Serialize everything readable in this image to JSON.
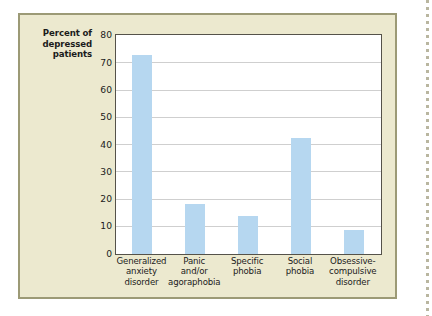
{
  "chart_data": {
    "type": "bar",
    "title": "",
    "xlabel": "",
    "ylabel": "Percent of depressed patients",
    "ylabel_lines": [
      "Percent of",
      "depressed",
      "patients"
    ],
    "ylim": [
      0,
      80
    ],
    "ytick_values": [
      0,
      10,
      20,
      30,
      40,
      50,
      60,
      70,
      80
    ],
    "ytick_labels": [
      "0",
      "10",
      "20",
      "30",
      "40",
      "50",
      "60",
      "70",
      "80"
    ],
    "grid": true,
    "legend": "none",
    "bar_color": "#b6d7f0",
    "plot_background": "#ffffff",
    "panel_background": "#ece9cf",
    "panel_border_color": "#9c9a76",
    "gridline_color": "#cfcfcf",
    "axis_color": "#55524a",
    "categories": [
      "Generalized anxiety disorder",
      "Panic and/or agoraphobia",
      "Specific phobia",
      "Social phobia",
      "Obsessive-compulsive disorder"
    ],
    "category_label_lines": [
      [
        "Generalized",
        "anxiety",
        "disorder"
      ],
      [
        "Panic",
        "and/or",
        "agoraphobia"
      ],
      [
        "Specific",
        "phobia"
      ],
      [
        "Social",
        "phobia"
      ],
      [
        "Obsessive-",
        "compulsive",
        "disorder"
      ]
    ],
    "values": [
      73,
      18.5,
      14,
      42.5,
      8.7
    ]
  }
}
